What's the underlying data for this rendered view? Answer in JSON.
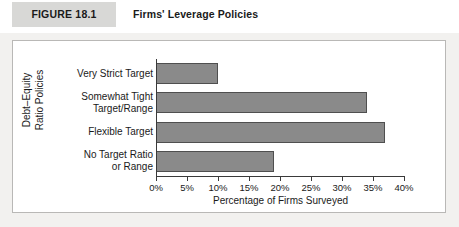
{
  "header": {
    "figure_tag": "FIGURE 18.1",
    "title": "Firms' Leverage Policies"
  },
  "colors": {
    "bar_fill": "#8a8a8a",
    "bar_border": "#4f4f4f",
    "panel_background": "#ffffff",
    "panel_border": "#b9b8b6",
    "page_background": "#f2f1ef",
    "figure_tag_background": "#d8d8d6",
    "axis": "#3a3a3a",
    "text": "#1a1a1a"
  },
  "chart_data": {
    "type": "bar",
    "orientation": "horizontal",
    "title": "Firms' Leverage Policies",
    "categories": [
      "Very Strict Target",
      "Somewhat Tight Target/Range",
      "Flexible Target",
      "No Target Ratio or Range"
    ],
    "category_lines": [
      [
        "Very Strict Target"
      ],
      [
        "Somewhat Tight",
        "Target/Range"
      ],
      [
        "Flexible Target"
      ],
      [
        "No Target Ratio",
        "or Range"
      ]
    ],
    "values": [
      10,
      34,
      37,
      19
    ],
    "value_unit": "percent",
    "xlabel": "Percentage of Firms Surveyed",
    "ylabel": "Debt–Equity Ratio Policies",
    "ylabel_lines": [
      "Debt–Equity",
      "Ratio Policies"
    ],
    "xlim": [
      0,
      40
    ],
    "xticks": [
      0,
      5,
      10,
      15,
      20,
      25,
      30,
      35,
      40
    ],
    "xticklabels": [
      "0%",
      "5%",
      "10%",
      "15%",
      "20%",
      "25%",
      "30%",
      "35%",
      "40%"
    ],
    "grid": false,
    "legend": false
  }
}
